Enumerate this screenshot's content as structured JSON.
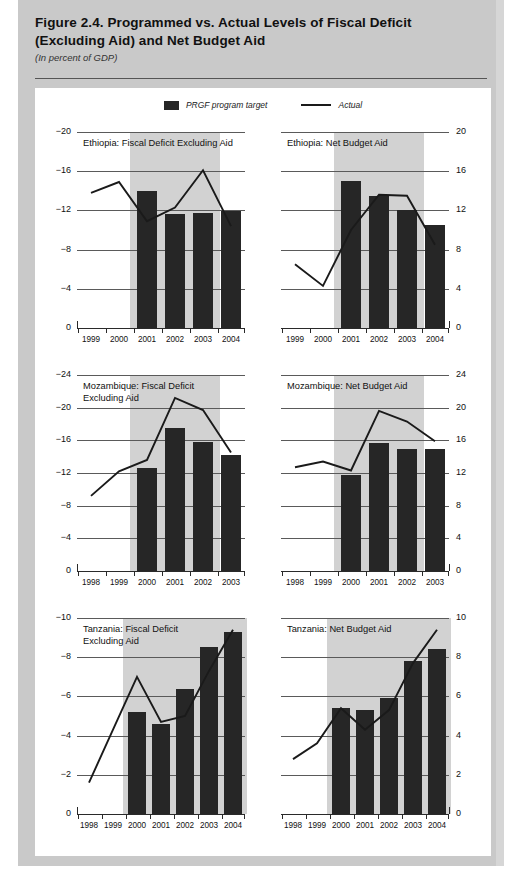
{
  "figure": {
    "title": "Figure 2.4. Programmed vs.  Actual Levels of Fiscal Deficit (Excluding Aid) and Net Budget Aid",
    "title_line1": "Figure 2.4. Programmed vs.  Actual Levels of Fiscal Deficit",
    "title_line2": "(Excluding Aid) and Net Budget Aid",
    "subtitle": "(In percent of GDP)"
  },
  "legend": {
    "bar_label": "PRGF program target",
    "line_label": "Actual",
    "bar_color": "#262626",
    "line_color": "#1a1a1a",
    "band_color": "#d2d2d2"
  },
  "chart_data": [
    {
      "type": "bar",
      "id": "ethiopia-fiscal-deficit",
      "title": "Ethiopia: Fiscal Deficit Excluding Aid",
      "xlabel": "",
      "ylabel": "",
      "inverted": true,
      "ylim": [
        0,
        -20
      ],
      "yticks": [
        0,
        -4,
        -8,
        -12,
        -16,
        -20
      ],
      "ytick_labels": [
        "0",
        "−4",
        "−8",
        "−12",
        "−16",
        "−20"
      ],
      "yaxis_side": "left",
      "categories": [
        "1999",
        "2000",
        "2001",
        "2002",
        "2003",
        "2004"
      ],
      "shaded_from": "2001",
      "shaded_to": "2003",
      "series": [
        {
          "name": "PRGF program target",
          "type": "bar",
          "values": [
            null,
            null,
            -14.0,
            -11.6,
            -11.7,
            -11.9
          ]
        },
        {
          "name": "Actual",
          "type": "line",
          "values": [
            -13.8,
            -14.9,
            -10.9,
            -12.3,
            -16.1,
            -10.4
          ]
        }
      ]
    },
    {
      "type": "bar",
      "id": "ethiopia-net-budget-aid",
      "title": "Ethiopia: Net Budget Aid",
      "xlabel": "",
      "ylabel": "",
      "inverted": false,
      "ylim": [
        0,
        20
      ],
      "yticks": [
        0,
        4,
        8,
        12,
        16,
        20
      ],
      "ytick_labels": [
        "0",
        "4",
        "8",
        "12",
        "16",
        "20"
      ],
      "yaxis_side": "right",
      "categories": [
        "1999",
        "2000",
        "2001",
        "2002",
        "2003",
        "2004"
      ],
      "shaded_from": "2001",
      "shaded_to": "2003",
      "series": [
        {
          "name": "PRGF program target",
          "type": "bar",
          "values": [
            null,
            null,
            15.0,
            13.5,
            12.0,
            10.5
          ]
        },
        {
          "name": "Actual",
          "type": "line",
          "values": [
            6.5,
            4.3,
            10.0,
            13.6,
            13.5,
            8.5
          ]
        }
      ]
    },
    {
      "type": "bar",
      "id": "mozambique-fiscal-deficit",
      "title": "Mozambique: Fiscal Deficit\nExcluding Aid",
      "xlabel": "",
      "ylabel": "",
      "inverted": true,
      "ylim": [
        0,
        -24
      ],
      "yticks": [
        0,
        -4,
        -8,
        -12,
        -16,
        -20,
        -24
      ],
      "ytick_labels": [
        "0",
        "−4",
        "−8",
        "−12",
        "−16",
        "−20",
        "−24"
      ],
      "yaxis_side": "left",
      "categories": [
        "1998",
        "1999",
        "2000",
        "2001",
        "2002",
        "2003"
      ],
      "shaded_from": "2000",
      "shaded_to": "2002",
      "series": [
        {
          "name": "PRGF program target",
          "type": "bar",
          "values": [
            null,
            null,
            -12.6,
            -17.5,
            -15.8,
            -14.2
          ]
        },
        {
          "name": "Actual",
          "type": "line",
          "values": [
            -9.2,
            -12.2,
            -13.6,
            -21.2,
            -19.7,
            -14.5
          ]
        }
      ]
    },
    {
      "type": "bar",
      "id": "mozambique-net-budget-aid",
      "title": "Mozambique: Net Budget Aid",
      "xlabel": "",
      "ylabel": "",
      "inverted": false,
      "ylim": [
        0,
        24
      ],
      "yticks": [
        0,
        4,
        8,
        12,
        16,
        20,
        24
      ],
      "ytick_labels": [
        "0",
        "4",
        "8",
        "12",
        "16",
        "20",
        "24"
      ],
      "yaxis_side": "right",
      "categories": [
        "1998",
        "1999",
        "2000",
        "2001",
        "2002",
        "2003"
      ],
      "shaded_from": "2000",
      "shaded_to": "2002",
      "series": [
        {
          "name": "PRGF program target",
          "type": "bar",
          "values": [
            null,
            null,
            11.8,
            15.7,
            15.0,
            15.0
          ]
        },
        {
          "name": "Actual",
          "type": "line",
          "values": [
            12.7,
            13.4,
            12.3,
            19.6,
            18.3,
            15.9
          ]
        }
      ]
    },
    {
      "type": "bar",
      "id": "tanzania-fiscal-deficit",
      "title": "Tanzania: Fiscal Deficit\nExcluding Aid",
      "xlabel": "",
      "ylabel": "",
      "inverted": true,
      "ylim": [
        0,
        -10
      ],
      "yticks": [
        0,
        -2,
        -4,
        -6,
        -8,
        -10
      ],
      "ytick_labels": [
        "0",
        "−2",
        "−4",
        "−6",
        "−8",
        "−10"
      ],
      "yaxis_side": "left",
      "categories": [
        "1998",
        "1999",
        "2000",
        "2001",
        "2002",
        "2003",
        "2004"
      ],
      "shaded_from": "2000",
      "shaded_to": "2004",
      "series": [
        {
          "name": "PRGF program target",
          "type": "bar",
          "values": [
            null,
            null,
            -5.2,
            -4.6,
            -6.4,
            -8.5,
            -9.3
          ]
        },
        {
          "name": "Actual",
          "type": "line",
          "values": [
            -1.6,
            -4.3,
            -7.0,
            -4.7,
            -5.0,
            -7.3,
            -9.4
          ]
        }
      ]
    },
    {
      "type": "bar",
      "id": "tanzania-net-budget-aid",
      "title": "Tanzania: Net Budget Aid",
      "xlabel": "",
      "ylabel": "",
      "inverted": false,
      "ylim": [
        0,
        10
      ],
      "yticks": [
        0,
        2,
        4,
        6,
        8,
        10
      ],
      "ytick_labels": [
        "0",
        "2",
        "4",
        "6",
        "8",
        "10"
      ],
      "yaxis_side": "right",
      "categories": [
        "1998",
        "1999",
        "2000",
        "2001",
        "2002",
        "2003",
        "2004"
      ],
      "shaded_from": "2000",
      "shaded_to": "2004",
      "series": [
        {
          "name": "PRGF program target",
          "type": "bar",
          "values": [
            null,
            null,
            5.4,
            5.3,
            5.9,
            7.8,
            8.4
          ]
        },
        {
          "name": "Actual",
          "type": "line",
          "values": [
            2.8,
            3.6,
            5.4,
            4.3,
            5.3,
            7.7,
            9.4
          ]
        }
      ]
    }
  ]
}
